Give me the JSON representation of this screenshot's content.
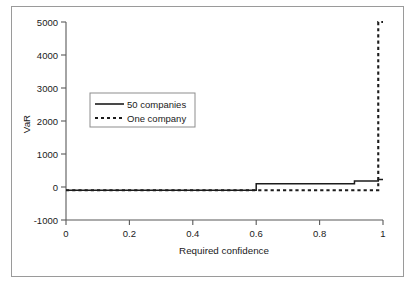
{
  "chart_data": {
    "type": "line",
    "title": "",
    "subtitle": "",
    "xlabel": "Required confidence",
    "ylabel": "VaR",
    "xlim": [
      0,
      1
    ],
    "ylim": [
      -1000,
      5000
    ],
    "xticks": [
      0,
      0.2,
      0.4,
      0.6,
      0.8,
      1
    ],
    "xtick_labels": [
      "0",
      "0.2",
      "0.4",
      "0.6",
      "0.8",
      "1"
    ],
    "yticks": [
      -1000,
      0,
      1000,
      2000,
      3000,
      4000,
      5000
    ],
    "ytick_labels": [
      "-1000",
      "0",
      "1000",
      "2000",
      "3000",
      "4000",
      "5000"
    ],
    "grid": false,
    "legend_position": "upper-left-inside",
    "series": [
      {
        "name": "50 companies",
        "style": "solid",
        "color": "#1c1c1c",
        "x": [
          0,
          0.6,
          0.6,
          0.91,
          0.91,
          0.985,
          0.985,
          1
        ],
        "y": [
          -100,
          -100,
          100,
          100,
          180,
          180,
          230,
          230
        ]
      },
      {
        "name": "One company",
        "style": "dashed",
        "color": "#1c1c1c",
        "x": [
          0,
          0.985,
          0.985,
          1
        ],
        "y": [
          -100,
          -100,
          5000,
          5000
        ]
      }
    ]
  },
  "legend": {
    "entries": [
      {
        "label": "50 companies",
        "style": "solid"
      },
      {
        "label": "One company",
        "style": "dashed"
      }
    ]
  },
  "axes": {
    "x_title": "Required confidence",
    "y_title": "VaR"
  },
  "colors": {
    "line": "#1c1c1c",
    "axis": "#595959",
    "frame": "#9a9a9a",
    "background": "#ffffff"
  }
}
